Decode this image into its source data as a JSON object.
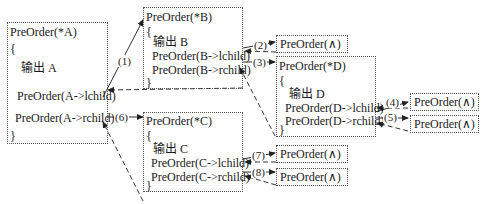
{
  "boxes": {
    "A": {
      "title": "PreOrder(*A)",
      "open": "{",
      "output": "输出 A",
      "lcall": "PreOrder(A->lchild)",
      "rcall": "PreOrder(A->rchild)",
      "close": "}"
    },
    "B": {
      "title": "PreOrder(*B)",
      "open": "{",
      "output": "输出 B",
      "lcall": "PreOrder(B->lchild)",
      "rcall": "PreOrder(B->rchild)",
      "close": "}"
    },
    "C": {
      "title": "PreOrder(*C)",
      "open": "{",
      "output": "输出 C",
      "lcall": "PreOrder(C->lchild)",
      "rcall": "PreOrder(C->rchild)",
      "close": "}"
    },
    "D": {
      "title": "PreOrder(*D)",
      "open": "{",
      "output": "输出 D",
      "lcall": "PreOrder(D->lchild)",
      "rcall": "PreOrder(D->rchild)",
      "close": "}"
    }
  },
  "null_calls": [
    {
      "id": "B-l",
      "text": "PreOrder(∧)"
    },
    {
      "id": "D-l",
      "text": "PreOrder(∧)"
    },
    {
      "id": "D-r",
      "text": "PreOrder(∧)"
    },
    {
      "id": "C-l",
      "text": "PreOrder(∧)"
    },
    {
      "id": "C-r",
      "text": "PreOrder(∧)"
    }
  ],
  "step_labels": [
    "(1)",
    "(2)",
    "(3)",
    "(4)",
    "(5)",
    "(6)",
    "(7)",
    "(8)"
  ],
  "colors": {
    "line": "#333333",
    "border": "#555555",
    "text": "#1a1a1a"
  }
}
